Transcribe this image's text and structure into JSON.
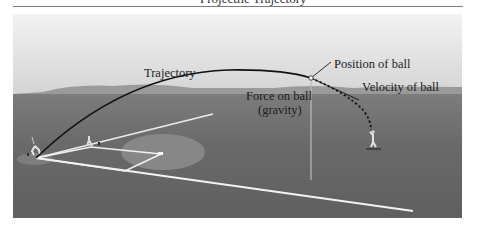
{
  "header": {
    "title_partial": "Projectile Trajectory"
  },
  "diagram": {
    "labels": {
      "trajectory": "Trajectory",
      "position": "Position of ball",
      "velocity": "Velocity of ball",
      "force_line1": "Force on ball",
      "force_line2": "(gravity)"
    },
    "colors": {
      "sky_top": "#efefef",
      "sky_bottom": "#d8d8d8",
      "hills": "#8f8f8f",
      "field": "#6f6f6f",
      "field_near": "#5e5e5e",
      "infield_dirt": "#858585",
      "chalk": "#f4f4f4",
      "trajectory": "#111111"
    }
  }
}
